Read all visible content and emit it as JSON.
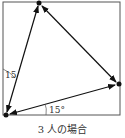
{
  "diagram": {
    "type": "geometry",
    "square": {
      "x1": 3,
      "y1": 2,
      "x2": 120,
      "y2": 115
    },
    "vertices": [
      {
        "name": "bottom-left",
        "x": 6,
        "y": 115
      },
      {
        "name": "top",
        "x": 39,
        "y": 3
      },
      {
        "name": "right",
        "x": 119,
        "y": 84
      }
    ],
    "angle_labels": [
      {
        "text": "15",
        "x": 6,
        "y": 78
      },
      {
        "text": "15°",
        "x": 48,
        "y": 113
      }
    ],
    "caption": "3 人の場合",
    "colors": {
      "line": "#111111",
      "square": "#555555"
    }
  }
}
